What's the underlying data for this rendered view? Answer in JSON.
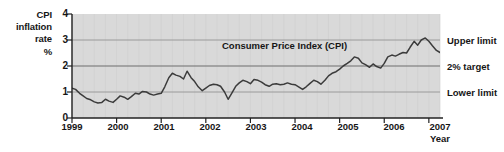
{
  "axes": {
    "y_title": [
      "CPI",
      "inflation",
      "rate",
      "%"
    ],
    "y_ticks": [
      "0",
      "1",
      "2",
      "3",
      "4"
    ],
    "x_title": "Year",
    "x_ticks": [
      "1999",
      "2000",
      "2001",
      "2002",
      "2003",
      "2004",
      "2005",
      "2006",
      "2007"
    ]
  },
  "annotations": {
    "series_label": "Consumer Price Index (CPI)",
    "upper_limit": "Upper limit",
    "target": "2% target",
    "lower_limit": "Lower limit"
  },
  "colors": {
    "plot_background": "#d9d9d9",
    "series_line": "#3b3b3b",
    "gridline": "#8c8c8c",
    "minor_gridline": "#cccccc",
    "axis": "#222222",
    "text": "#161616"
  },
  "chart_data": {
    "type": "line",
    "title": "",
    "subtitle": "",
    "xlabel": "Year",
    "ylabel": "CPI inflation rate %",
    "xlim": [
      1999.0,
      2007.25
    ],
    "ylim": [
      0,
      4
    ],
    "yticks": [
      0,
      1,
      2,
      3,
      4
    ],
    "xticks": [
      1999,
      2000,
      2001,
      2002,
      2003,
      2004,
      2005,
      2006,
      2007
    ],
    "grid": "horizontal gridlines at 1, 2 and 3; faint vertical minor gridlines",
    "legend": "none (inline series annotation)",
    "reference_lines": [
      {
        "label": "Upper limit",
        "value": 3
      },
      {
        "label": "2% target",
        "value": 2
      },
      {
        "label": "Lower limit",
        "value": 1
      }
    ],
    "series": [
      {
        "name": "Consumer Price Index (CPI)",
        "x": [
          1999.0,
          1999.08,
          1999.17,
          1999.25,
          1999.33,
          1999.42,
          1999.5,
          1999.58,
          1999.67,
          1999.75,
          1999.83,
          1999.92,
          2000.0,
          2000.08,
          2000.17,
          2000.25,
          2000.33,
          2000.42,
          2000.5,
          2000.58,
          2000.67,
          2000.75,
          2000.83,
          2000.92,
          2001.0,
          2001.08,
          2001.17,
          2001.25,
          2001.33,
          2001.42,
          2001.5,
          2001.58,
          2001.67,
          2001.75,
          2001.83,
          2001.92,
          2002.0,
          2002.08,
          2002.17,
          2002.25,
          2002.33,
          2002.42,
          2002.5,
          2002.58,
          2002.67,
          2002.75,
          2002.83,
          2002.92,
          2003.0,
          2003.08,
          2003.17,
          2003.25,
          2003.33,
          2003.42,
          2003.5,
          2003.58,
          2003.67,
          2003.75,
          2003.83,
          2003.92,
          2004.0,
          2004.08,
          2004.17,
          2004.25,
          2004.33,
          2004.42,
          2004.5,
          2004.58,
          2004.67,
          2004.75,
          2004.83,
          2004.92,
          2005.0,
          2005.08,
          2005.17,
          2005.25,
          2005.33,
          2005.42,
          2005.5,
          2005.58,
          2005.67,
          2005.75,
          2005.83,
          2005.92,
          2006.0,
          2006.08,
          2006.17,
          2006.25,
          2006.33,
          2006.42,
          2006.5,
          2006.58,
          2006.67,
          2006.75,
          2006.83,
          2006.92,
          2007.0,
          2007.08,
          2007.17,
          2007.25
        ],
        "values": [
          1.15,
          1.1,
          0.95,
          0.85,
          0.75,
          0.7,
          0.62,
          0.58,
          0.6,
          0.72,
          0.65,
          0.6,
          0.72,
          0.85,
          0.8,
          0.72,
          0.82,
          0.95,
          0.92,
          1.02,
          1.0,
          0.92,
          0.88,
          0.92,
          0.95,
          1.2,
          1.55,
          1.72,
          1.65,
          1.6,
          1.5,
          1.8,
          1.55,
          1.4,
          1.2,
          1.05,
          1.15,
          1.25,
          1.3,
          1.28,
          1.22,
          1.0,
          0.72,
          0.95,
          1.22,
          1.35,
          1.45,
          1.4,
          1.32,
          1.48,
          1.45,
          1.38,
          1.28,
          1.22,
          1.3,
          1.32,
          1.28,
          1.3,
          1.35,
          1.3,
          1.28,
          1.2,
          1.1,
          1.2,
          1.32,
          1.45,
          1.4,
          1.3,
          1.45,
          1.62,
          1.72,
          1.78,
          1.88,
          2.0,
          2.1,
          2.2,
          2.35,
          2.3,
          2.12,
          2.05,
          1.95,
          2.08,
          1.98,
          1.92,
          2.1,
          2.35,
          2.42,
          2.38,
          2.45,
          2.52,
          2.5,
          2.72,
          2.95,
          2.8,
          3.0,
          3.08,
          2.95,
          2.78,
          2.6,
          2.52
        ]
      }
    ]
  }
}
